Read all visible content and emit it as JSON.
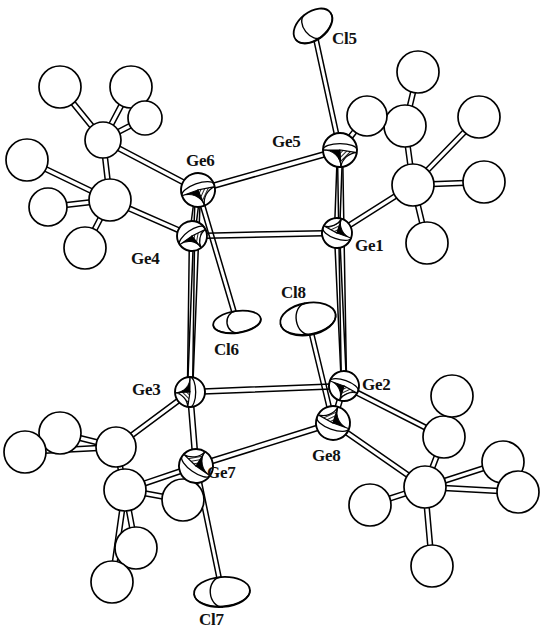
{
  "figure": {
    "kind": "ortep-thermal-ellipsoid-plot",
    "background_color": "#ffffff",
    "line_color": "#000000",
    "label_color": "#111111",
    "partial_top_text": ""
  },
  "atom_labels": [
    {
      "id": "Ge5",
      "text": "Ge5",
      "x": 272,
      "y": 133
    },
    {
      "id": "Ge6",
      "text": "Ge6",
      "x": 186,
      "y": 152
    },
    {
      "id": "Ge1",
      "text": "Ge1",
      "x": 355,
      "y": 237
    },
    {
      "id": "Ge4",
      "text": "Ge4",
      "x": 131,
      "y": 250
    },
    {
      "id": "Cl5",
      "text": "Cl5",
      "x": 332,
      "y": 30
    },
    {
      "id": "Cl8",
      "text": "Cl8",
      "x": 281,
      "y": 284
    },
    {
      "id": "Cl6",
      "text": "Cl6",
      "x": 214,
      "y": 341
    },
    {
      "id": "Ge3",
      "text": "Ge3",
      "x": 132,
      "y": 381
    },
    {
      "id": "Ge2",
      "text": "Ge2",
      "x": 362,
      "y": 376
    },
    {
      "id": "Ge8",
      "text": "Ge8",
      "x": 312,
      "y": 447
    },
    {
      "id": "Ge7",
      "text": "Ge7",
      "x": 207,
      "y": 464
    },
    {
      "id": "Cl7",
      "text": "Cl7",
      "x": 199,
      "y": 611
    }
  ],
  "germanium_atoms": [
    {
      "id": "Ge1",
      "x": 337,
      "y": 233,
      "r": 15,
      "style": "quadrant-hatched",
      "rot": 20
    },
    {
      "id": "Ge2",
      "x": 344,
      "y": 386,
      "r": 15,
      "style": "quadrant-hatched",
      "rot": 200
    },
    {
      "id": "Ge3",
      "x": 190,
      "y": 392,
      "r": 15,
      "style": "quadrant-hatched",
      "rot": 270
    },
    {
      "id": "Ge4",
      "x": 192,
      "y": 236,
      "r": 15,
      "style": "quadrant-hatched",
      "rot": 145
    },
    {
      "id": "Ge5",
      "x": 340,
      "y": 150,
      "r": 17,
      "style": "quadrant-hatched",
      "rot": 180
    },
    {
      "id": "Ge6",
      "x": 198,
      "y": 190,
      "r": 17,
      "style": "quadrant-hatched",
      "rot": 160
    },
    {
      "id": "Ge7",
      "x": 196,
      "y": 466,
      "r": 17,
      "style": "quadrant-hatched",
      "rot": 35
    },
    {
      "id": "Ge8",
      "x": 333,
      "y": 423,
      "r": 17,
      "style": "quadrant-hatched",
      "rot": 20
    }
  ],
  "chlorine_atoms": [
    {
      "id": "Cl5",
      "x": 313,
      "y": 26,
      "rx": 22,
      "ry": 14,
      "rot": -38,
      "bond_to": "Ge5"
    },
    {
      "id": "Cl6",
      "x": 237,
      "y": 322,
      "rx": 24,
      "ry": 11,
      "rot": -8,
      "bond_to": "Ge6"
    },
    {
      "id": "Cl7",
      "x": 222,
      "y": 592,
      "rx": 28,
      "ry": 15,
      "rot": -4,
      "bond_to": "Ge7"
    },
    {
      "id": "Cl8",
      "x": 308,
      "y": 319,
      "rx": 28,
      "ry": 16,
      "rot": -10,
      "bond_to": "Ge8"
    }
  ],
  "cluster_bonds": [
    [
      "Ge6",
      "Ge5"
    ],
    [
      "Ge6",
      "Ge4"
    ],
    [
      "Ge5",
      "Ge1"
    ],
    [
      "Ge4",
      "Ge1"
    ],
    [
      "Ge4",
      "Ge3"
    ],
    [
      "Ge1",
      "Ge2"
    ],
    [
      "Ge3",
      "Ge2"
    ],
    [
      "Ge3",
      "Ge7"
    ],
    [
      "Ge2",
      "Ge8"
    ],
    [
      "Ge7",
      "Ge8"
    ],
    [
      "Ge6",
      "Ge3"
    ],
    [
      "Ge5",
      "Ge2"
    ]
  ],
  "substituent_groups": [
    {
      "id": "silyl-upper-left",
      "attached_to": "Ge4",
      "center": {
        "x": 110,
        "y": 200
      },
      "atoms": [
        {
          "id": "C-ul-1",
          "x": 110,
          "y": 200,
          "r": 21
        },
        {
          "id": "C-ul-2",
          "x": 103,
          "y": 140,
          "r": 18
        },
        {
          "id": "C-ul-3",
          "x": 60,
          "y": 87,
          "r": 21
        },
        {
          "id": "C-ul-4",
          "x": 131,
          "y": 87,
          "r": 21
        },
        {
          "id": "C-ul-5",
          "x": 145,
          "y": 118,
          "r": 17
        },
        {
          "id": "C-ul-6",
          "x": 27,
          "y": 160,
          "r": 21
        },
        {
          "id": "C-ul-7",
          "x": 48,
          "y": 207,
          "r": 19
        },
        {
          "id": "C-ul-8",
          "x": 85,
          "y": 248,
          "r": 21
        }
      ],
      "bonds": [
        [
          "C-ul-1",
          "C-ul-2"
        ],
        [
          "C-ul-1",
          "C-ul-6"
        ],
        [
          "C-ul-1",
          "C-ul-7"
        ],
        [
          "C-ul-1",
          "C-ul-8"
        ],
        [
          "C-ul-2",
          "C-ul-3"
        ],
        [
          "C-ul-2",
          "C-ul-4"
        ],
        [
          "C-ul-2",
          "C-ul-5"
        ],
        [
          "C-ul-1",
          "Ge4"
        ],
        [
          "C-ul-2",
          "Ge6"
        ]
      ]
    },
    {
      "id": "silyl-upper-right",
      "attached_to": "Ge1",
      "center": {
        "x": 413,
        "y": 185
      },
      "atoms": [
        {
          "id": "C-ur-1",
          "x": 413,
          "y": 185,
          "r": 21
        },
        {
          "id": "C-ur-2",
          "x": 405,
          "y": 126,
          "r": 21
        },
        {
          "id": "C-ur-3",
          "x": 418,
          "y": 72,
          "r": 21
        },
        {
          "id": "C-ur-4",
          "x": 367,
          "y": 116,
          "r": 20
        },
        {
          "id": "C-ur-5",
          "x": 479,
          "y": 117,
          "r": 21
        },
        {
          "id": "C-ur-6",
          "x": 484,
          "y": 182,
          "r": 21
        },
        {
          "id": "C-ur-7",
          "x": 427,
          "y": 243,
          "r": 21
        }
      ],
      "bonds": [
        [
          "C-ur-1",
          "C-ur-2"
        ],
        [
          "C-ur-1",
          "C-ur-5"
        ],
        [
          "C-ur-1",
          "C-ur-6"
        ],
        [
          "C-ur-1",
          "C-ur-7"
        ],
        [
          "C-ur-2",
          "C-ur-3"
        ],
        [
          "C-ur-2",
          "C-ur-4"
        ],
        [
          "C-ur-1",
          "Ge1"
        ],
        [
          "C-ur-4",
          "Ge5"
        ]
      ]
    },
    {
      "id": "silyl-lower-left",
      "attached_to": "Ge7",
      "center": {
        "x": 125,
        "y": 490
      },
      "atoms": [
        {
          "id": "C-ll-1",
          "x": 125,
          "y": 490,
          "r": 21
        },
        {
          "id": "C-ll-2",
          "x": 116,
          "y": 447,
          "r": 20
        },
        {
          "id": "C-ll-3",
          "x": 60,
          "y": 433,
          "r": 21
        },
        {
          "id": "C-ll-4",
          "x": 25,
          "y": 452,
          "r": 21
        },
        {
          "id": "C-ll-5",
          "x": 136,
          "y": 548,
          "r": 21
        },
        {
          "id": "C-ll-6",
          "x": 112,
          "y": 582,
          "r": 21
        },
        {
          "id": "C-ll-7",
          "x": 183,
          "y": 500,
          "r": 21
        }
      ],
      "bonds": [
        [
          "C-ll-1",
          "C-ll-2"
        ],
        [
          "C-ll-1",
          "C-ll-5"
        ],
        [
          "C-ll-1",
          "C-ll-6"
        ],
        [
          "C-ll-1",
          "C-ll-7"
        ],
        [
          "C-ll-2",
          "C-ll-3"
        ],
        [
          "C-ll-2",
          "C-ll-4"
        ],
        [
          "C-ll-1",
          "Ge7"
        ],
        [
          "C-ll-2",
          "Ge3"
        ]
      ]
    },
    {
      "id": "silyl-lower-right",
      "attached_to": "Ge8",
      "center": {
        "x": 425,
        "y": 487
      },
      "atoms": [
        {
          "id": "C-lr-1",
          "x": 425,
          "y": 487,
          "r": 21
        },
        {
          "id": "C-lr-2",
          "x": 444,
          "y": 437,
          "r": 21
        },
        {
          "id": "C-lr-3",
          "x": 452,
          "y": 396,
          "r": 21
        },
        {
          "id": "C-lr-4",
          "x": 503,
          "y": 462,
          "r": 21
        },
        {
          "id": "C-lr-5",
          "x": 518,
          "y": 492,
          "r": 21
        },
        {
          "id": "C-lr-6",
          "x": 370,
          "y": 505,
          "r": 21
        },
        {
          "id": "C-lr-7",
          "x": 432,
          "y": 566,
          "r": 21
        }
      ],
      "bonds": [
        [
          "C-lr-1",
          "C-lr-2"
        ],
        [
          "C-lr-1",
          "C-lr-4"
        ],
        [
          "C-lr-1",
          "C-lr-5"
        ],
        [
          "C-lr-1",
          "C-lr-6"
        ],
        [
          "C-lr-1",
          "C-lr-7"
        ],
        [
          "C-lr-2",
          "C-lr-3"
        ],
        [
          "C-lr-1",
          "Ge8"
        ],
        [
          "C-lr-2",
          "Ge2"
        ]
      ]
    }
  ]
}
